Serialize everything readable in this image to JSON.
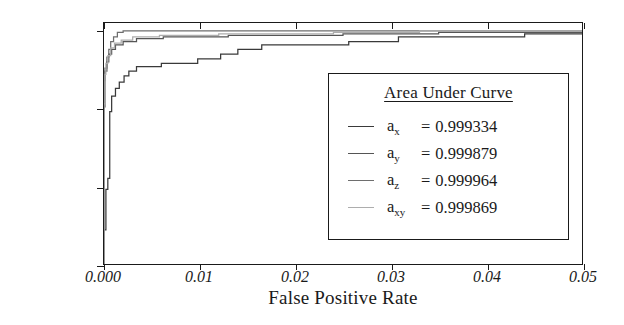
{
  "chart_data": {
    "type": "line",
    "title": "",
    "xlabel": "False Positive Rate",
    "ylabel": "True Positive Rate",
    "xlim": [
      0.0,
      0.05
    ],
    "ylim": [
      0.85,
      1.005
    ],
    "grid": false,
    "xticks": [
      0.0,
      0.01,
      0.02,
      0.03,
      0.04,
      0.05
    ],
    "xticklabels": [
      "0.000",
      "0.01",
      "0.02",
      "0.03",
      "0.04",
      "0.05"
    ],
    "yticks": [
      1.0,
      0.95,
      0.9,
      0.85
    ],
    "yticklabels": [
      "1.0",
      "0.95",
      "0.90",
      "0.85"
    ],
    "legend": {
      "position": "lower right",
      "title": "Area Under Curve",
      "entries": [
        {
          "name": "a",
          "sub": "x",
          "equals": "=",
          "value": "0.999334",
          "color": "#3a3a3a"
        },
        {
          "name": "a",
          "sub": "y",
          "equals": "=",
          "value": "0.999879",
          "color": "#555555"
        },
        {
          "name": "a",
          "sub": "z",
          "equals": "=",
          "value": "0.999964",
          "color": "#6e6e6e"
        },
        {
          "name": "a",
          "sub": "xy",
          "equals": "=",
          "value": "0.999869",
          "color": "#adadad"
        }
      ]
    },
    "series": [
      {
        "name": "a_x",
        "auc": 0.999334,
        "color": "#3a3a3a",
        "points": [
          [
            0.0,
            0.85
          ],
          [
            0.0,
            0.872
          ],
          [
            0.0002,
            0.872
          ],
          [
            0.0002,
            0.898
          ],
          [
            0.0004,
            0.898
          ],
          [
            0.0004,
            0.905
          ],
          [
            0.0006,
            0.905
          ],
          [
            0.0006,
            0.948
          ],
          [
            0.0008,
            0.948
          ],
          [
            0.0008,
            0.958
          ],
          [
            0.0012,
            0.958
          ],
          [
            0.0012,
            0.963
          ],
          [
            0.0016,
            0.963
          ],
          [
            0.0016,
            0.967
          ],
          [
            0.0021,
            0.967
          ],
          [
            0.0021,
            0.971
          ],
          [
            0.0026,
            0.971
          ],
          [
            0.0026,
            0.974
          ],
          [
            0.0034,
            0.974
          ],
          [
            0.0034,
            0.977
          ],
          [
            0.006,
            0.977
          ],
          [
            0.006,
            0.979
          ],
          [
            0.0098,
            0.979
          ],
          [
            0.0098,
            0.982
          ],
          [
            0.0122,
            0.982
          ],
          [
            0.0122,
            0.985
          ],
          [
            0.014,
            0.985
          ],
          [
            0.014,
            0.988
          ],
          [
            0.0165,
            0.988
          ],
          [
            0.0165,
            0.991
          ],
          [
            0.0256,
            0.991
          ],
          [
            0.0256,
            0.993
          ],
          [
            0.0308,
            0.993
          ],
          [
            0.0308,
            0.996
          ],
          [
            0.044,
            0.996
          ],
          [
            0.044,
            0.998
          ],
          [
            0.05,
            0.998
          ]
        ]
      },
      {
        "name": "a_y",
        "auc": 0.999879,
        "color": "#555555",
        "points": [
          [
            0.0,
            0.85
          ],
          [
            0.0,
            0.951
          ],
          [
            0.0001,
            0.951
          ],
          [
            0.0001,
            0.974
          ],
          [
            0.0003,
            0.974
          ],
          [
            0.0003,
            0.98
          ],
          [
            0.0005,
            0.98
          ],
          [
            0.0005,
            0.985
          ],
          [
            0.0008,
            0.985
          ],
          [
            0.0008,
            0.988
          ],
          [
            0.0012,
            0.988
          ],
          [
            0.0012,
            0.991
          ],
          [
            0.002,
            0.991
          ],
          [
            0.002,
            0.993
          ],
          [
            0.0034,
            0.993
          ],
          [
            0.0034,
            0.995
          ],
          [
            0.0062,
            0.995
          ],
          [
            0.0062,
            0.996
          ],
          [
            0.013,
            0.996
          ],
          [
            0.013,
            0.997
          ],
          [
            0.025,
            0.997
          ],
          [
            0.025,
            0.998
          ],
          [
            0.035,
            0.998
          ],
          [
            0.035,
            0.999
          ],
          [
            0.05,
            0.999
          ]
        ]
      },
      {
        "name": "a_z",
        "auc": 0.999964,
        "color": "#6e6e6e",
        "points": [
          [
            0.0,
            0.85
          ],
          [
            0.0,
            0.968
          ],
          [
            0.0001,
            0.968
          ],
          [
            0.0001,
            0.976
          ],
          [
            0.0003,
            0.976
          ],
          [
            0.0003,
            0.983
          ],
          [
            0.0005,
            0.983
          ],
          [
            0.0005,
            0.988
          ],
          [
            0.0007,
            0.988
          ],
          [
            0.0007,
            0.993
          ],
          [
            0.001,
            0.993
          ],
          [
            0.001,
            0.996
          ],
          [
            0.0014,
            0.996
          ],
          [
            0.0014,
            0.999
          ],
          [
            0.002,
            0.999
          ],
          [
            0.002,
            1.0
          ],
          [
            0.05,
            1.0
          ]
        ]
      },
      {
        "name": "a_xy",
        "auc": 0.999869,
        "color": "#adadad",
        "points": [
          [
            0.0,
            0.85
          ],
          [
            0.0,
            0.953
          ],
          [
            0.0001,
            0.953
          ],
          [
            0.0001,
            0.972
          ],
          [
            0.0002,
            0.972
          ],
          [
            0.0002,
            0.979
          ],
          [
            0.0004,
            0.979
          ],
          [
            0.0004,
            0.984
          ],
          [
            0.0007,
            0.984
          ],
          [
            0.0007,
            0.989
          ],
          [
            0.0011,
            0.989
          ],
          [
            0.0011,
            0.992
          ],
          [
            0.0018,
            0.992
          ],
          [
            0.0018,
            0.994
          ],
          [
            0.003,
            0.994
          ],
          [
            0.003,
            0.996
          ],
          [
            0.0058,
            0.996
          ],
          [
            0.0058,
            0.997
          ],
          [
            0.012,
            0.997
          ],
          [
            0.012,
            0.998
          ],
          [
            0.024,
            0.998
          ],
          [
            0.024,
            0.999
          ],
          [
            0.033,
            0.999
          ],
          [
            0.033,
            1.0
          ],
          [
            0.05,
            1.0
          ]
        ]
      }
    ]
  }
}
